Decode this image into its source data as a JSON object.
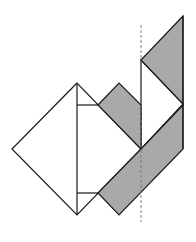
{
  "diagram": {
    "colors": {
      "background": "#ffffff",
      "stroke": "#1a1a1a",
      "gray_fill": "#a9a9a9",
      "dashed_line": "#777777",
      "faint_line": "#d9d9d9"
    },
    "shapes": {
      "big_diamond": "77,83 12,149 77,215 141,149",
      "upper_gray_quad": "98,105 119,83 141,105 141,149",
      "lower_gray_band": "98,193 141,149 183,105 183,149 119,215",
      "top_gray_triangle": "183,16 141,60 183,104",
      "white_triangle": "141,60 183,104 141,149",
      "vertical_center_line": {
        "x": 77,
        "y1": 83,
        "y2": 215
      },
      "upper_tick_line": {
        "x1": 77,
        "x2": 98,
        "y": 105
      },
      "lower_tick_line": {
        "x1": 77,
        "x2": 98,
        "y": 193
      },
      "fold_line": {
        "x": 141,
        "y1": 25,
        "y2": 222
      }
    }
  }
}
